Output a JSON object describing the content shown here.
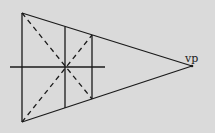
{
  "diagram": {
    "vanishing_point_label": "vp",
    "elements": [
      "front-vertical-edge",
      "top-convergence-line",
      "bottom-convergence-line",
      "horizon-line",
      "vertical-divider-1",
      "vertical-divider-2",
      "diagonal-1",
      "diagonal-2"
    ]
  },
  "colors": {
    "background": "#dadada",
    "stroke": "#1a1a1a"
  }
}
